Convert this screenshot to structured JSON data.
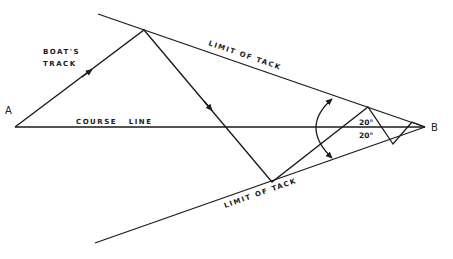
{
  "diagram": {
    "points": {
      "start": "A",
      "end": "B"
    },
    "labels": {
      "boats_track_line1": "BOAT'S",
      "boats_track_line2": "TRACK",
      "course_line": "COURSE   LINE",
      "limit_upper": "LIMIT OF TACK",
      "limit_lower": "LIMIT OF TACK",
      "angle_upper": "20°",
      "angle_lower": "20°"
    },
    "colors": {
      "ink": "#1a1a1a",
      "background": "#ffffff"
    }
  }
}
